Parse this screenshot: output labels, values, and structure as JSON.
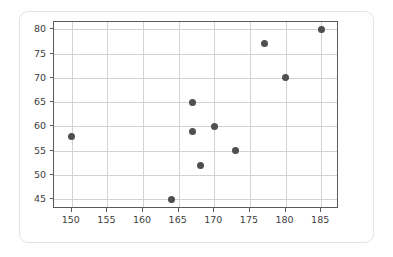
{
  "chart_data": {
    "type": "scatter",
    "title": "",
    "xlabel": "",
    "ylabel": "",
    "xlim": [
      147.5,
      187.5
    ],
    "ylim": [
      43.0,
      81.5
    ],
    "grid": true,
    "legend": null,
    "marker_color": "#4f4f4f",
    "axis_color": "#5a5a5a",
    "grid_color": "#d2d2d2",
    "background": "#ffffff",
    "xticks": [
      150,
      155,
      160,
      165,
      170,
      175,
      180,
      185
    ],
    "yticks": [
      45,
      50,
      55,
      60,
      65,
      70,
      75,
      80
    ],
    "xtick_labels": [
      "150",
      "155",
      "160",
      "165",
      "170",
      "175",
      "180",
      "185"
    ],
    "ytick_labels": [
      "45",
      "50",
      "55",
      "60",
      "65",
      "70",
      "75",
      "80"
    ],
    "points": [
      {
        "x": 150,
        "y": 58
      },
      {
        "x": 164,
        "y": 45
      },
      {
        "x": 167,
        "y": 65
      },
      {
        "x": 167,
        "y": 59
      },
      {
        "x": 168,
        "y": 52
      },
      {
        "x": 170,
        "y": 60
      },
      {
        "x": 173,
        "y": 55
      },
      {
        "x": 177,
        "y": 77
      },
      {
        "x": 180,
        "y": 70
      },
      {
        "x": 185,
        "y": 80
      }
    ]
  }
}
